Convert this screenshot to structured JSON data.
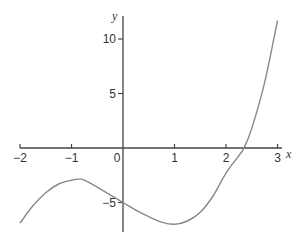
{
  "chart_data": {
    "type": "line",
    "title": "",
    "xlabel": "x",
    "ylabel": "y",
    "xlim": [
      -2,
      3
    ],
    "ylim": [
      -8,
      12
    ],
    "grid": false,
    "legend": null,
    "x_ticks": [
      -2,
      -1,
      0,
      1,
      2,
      3
    ],
    "x_tick_labels": [
      "-2",
      "-1",
      "0",
      "1",
      "2",
      "3"
    ],
    "y_ticks": [
      -5,
      5,
      10
    ],
    "y_tick_labels": [
      "-5",
      "5",
      "10"
    ],
    "series": [
      {
        "name": "f(x)",
        "color": "#888888",
        "x": [
          -2.0,
          -1.75,
          -1.5,
          -1.25,
          -1.0,
          -0.85,
          -0.75,
          -0.5,
          -0.25,
          0.0,
          0.25,
          0.5,
          0.75,
          1.0,
          1.25,
          1.5,
          1.75,
          2.0,
          2.25,
          2.35,
          2.5,
          2.75,
          3.0
        ],
        "y": [
          -6.9,
          -5.3,
          -4.1,
          -3.3,
          -2.95,
          -2.85,
          -2.95,
          -3.6,
          -4.3,
          -5.0,
          -5.7,
          -6.3,
          -6.8,
          -7.0,
          -6.7,
          -5.9,
          -4.4,
          -2.3,
          -0.7,
          0.0,
          1.8,
          6.0,
          11.7
        ]
      }
    ],
    "annotations": []
  },
  "axes": {
    "x_label": "x",
    "y_label": "y",
    "origin_label": "0"
  }
}
